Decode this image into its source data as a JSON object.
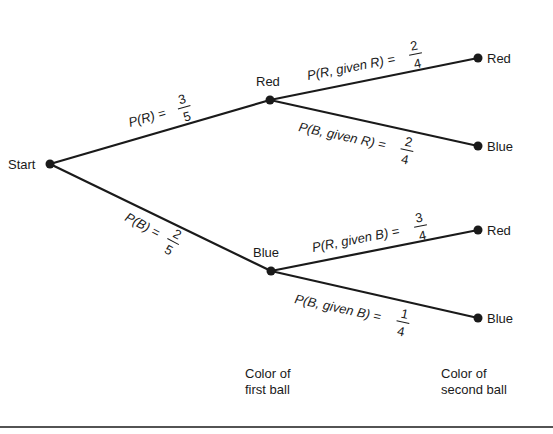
{
  "diagram": {
    "type": "probability-tree",
    "root": {
      "label": "Start"
    },
    "first_level": [
      {
        "label": "Red",
        "branch_prob": {
          "text": "P(R) =",
          "num": "3",
          "den": "5"
        }
      },
      {
        "label": "Blue",
        "branch_prob": {
          "text": "P(B) =",
          "num": "2",
          "den": "5"
        }
      }
    ],
    "second_level": [
      {
        "parent": "Red",
        "label": "Red",
        "branch_prob": {
          "text": "P(R, given R) =",
          "num": "2",
          "den": "4"
        }
      },
      {
        "parent": "Red",
        "label": "Blue",
        "branch_prob": {
          "text": "P(B, given R) =",
          "num": "2",
          "den": "4"
        }
      },
      {
        "parent": "Blue",
        "label": "Red",
        "branch_prob": {
          "text": "P(R, given B) =",
          "num": "3",
          "den": "4"
        }
      },
      {
        "parent": "Blue",
        "label": "Blue",
        "branch_prob": {
          "text": "P(B, given B) =",
          "num": "1",
          "den": "4"
        }
      }
    ],
    "captions": {
      "first": {
        "line1": "Color of",
        "line2": "first ball"
      },
      "second": {
        "line1": "Color of",
        "line2": "second ball"
      }
    },
    "colors": {
      "ink": "#1a1a1a",
      "background": "#ffffff"
    }
  }
}
